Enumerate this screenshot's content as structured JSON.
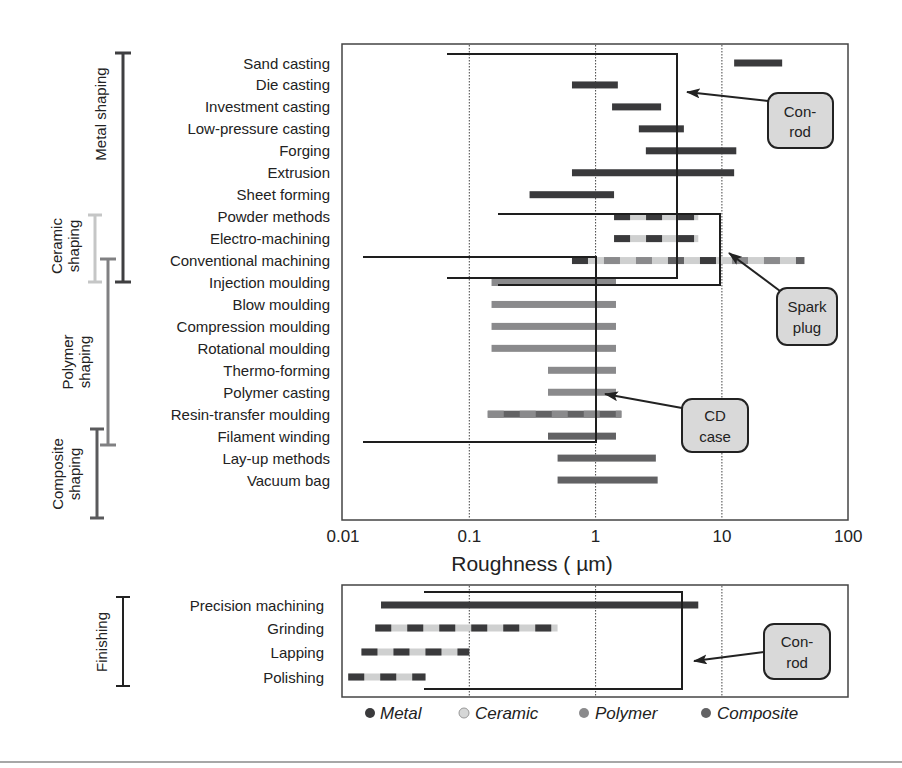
{
  "chart_data": [
    {
      "type": "bar",
      "subtype": "range-bar (floating horizontal bars, log x-axis)",
      "panel": "shaping",
      "xlabel": "Roughness ( µm)",
      "xscale": "log",
      "xlim": [
        0.01,
        100
      ],
      "xticks": [
        "0.01",
        "0.1",
        "1",
        "10",
        "100"
      ],
      "grid": "vertical dotted lines at 0.1, 1, 10",
      "categories": [
        "Sand casting",
        "Die casting",
        "Investment casting",
        "Low-pressure casting",
        "Forging",
        "Extrusion",
        "Sheet forming",
        "Powder methods",
        "Electro-machining",
        "Conventional machining",
        "Injection moulding",
        "Blow moulding",
        "Compression moulding",
        "Rotational moulding",
        "Thermo-forming",
        "Polymer casting",
        "Resin-transfer moulding",
        "Filament winding",
        "Lay-up methods",
        "Vacuum bag"
      ],
      "ranges": [
        {
          "process": "Sand casting",
          "min": 12.5,
          "max": 30,
          "materials": [
            "Metal"
          ]
        },
        {
          "process": "Die casting",
          "min": 0.65,
          "max": 1.5,
          "materials": [
            "Metal"
          ]
        },
        {
          "process": "Investment casting",
          "min": 1.35,
          "max": 3.3,
          "materials": [
            "Metal"
          ]
        },
        {
          "process": "Low-pressure casting",
          "min": 2.2,
          "max": 5,
          "materials": [
            "Metal"
          ]
        },
        {
          "process": "Forging",
          "min": 2.5,
          "max": 13,
          "materials": [
            "Metal"
          ]
        },
        {
          "process": "Extrusion",
          "min": 0.65,
          "max": 12.5,
          "materials": [
            "Metal"
          ]
        },
        {
          "process": "Sheet forming",
          "min": 0.3,
          "max": 1.4,
          "materials": [
            "Metal"
          ]
        },
        {
          "process": "Powder methods",
          "min": 1.4,
          "max": 6.5,
          "materials": [
            "Metal",
            "Ceramic"
          ]
        },
        {
          "process": "Electro-machining",
          "min": 1.4,
          "max": 6.5,
          "materials": [
            "Metal",
            "Ceramic"
          ]
        },
        {
          "process": "Conventional machining",
          "min": 0.65,
          "max": 45,
          "materials": [
            "Metal",
            "Ceramic",
            "Polymer",
            "Composite"
          ]
        },
        {
          "process": "Injection moulding",
          "min": 0.15,
          "max": 1.45,
          "materials": [
            "Polymer"
          ]
        },
        {
          "process": "Blow moulding",
          "min": 0.15,
          "max": 1.45,
          "materials": [
            "Polymer"
          ]
        },
        {
          "process": "Compression moulding",
          "min": 0.15,
          "max": 1.45,
          "materials": [
            "Polymer"
          ]
        },
        {
          "process": "Rotational moulding",
          "min": 0.15,
          "max": 1.45,
          "materials": [
            "Polymer"
          ]
        },
        {
          "process": "Thermo-forming",
          "min": 0.42,
          "max": 1.45,
          "materials": [
            "Polymer"
          ]
        },
        {
          "process": "Polymer casting",
          "min": 0.42,
          "max": 1.45,
          "materials": [
            "Polymer"
          ]
        },
        {
          "process": "Resin-transfer moulding",
          "min": 0.14,
          "max": 1.6,
          "materials": [
            "Polymer",
            "Composite"
          ]
        },
        {
          "process": "Filament winding",
          "min": 0.42,
          "max": 1.45,
          "materials": [
            "Composite"
          ]
        },
        {
          "process": "Lay-up methods",
          "min": 0.5,
          "max": 3.0,
          "materials": [
            "Composite"
          ]
        },
        {
          "process": "Vacuum bag",
          "min": 0.5,
          "max": 3.1,
          "materials": [
            "Composite"
          ]
        }
      ],
      "groups": [
        {
          "label": "Metal shaping",
          "from": "Sand casting",
          "to": "Conventional machining"
        },
        {
          "label": "Ceramic shaping",
          "from": "Powder methods",
          "to": "Conventional machining"
        },
        {
          "label": "Polymer shaping",
          "from": "Conventional machining",
          "to": "Resin-transfer moulding"
        },
        {
          "label": "Composite shaping",
          "from": "Resin-transfer moulding",
          "to": "Vacuum bag"
        }
      ],
      "annotations": [
        {
          "label": "Con-rod",
          "box_min": 0.07,
          "box_max": 4.4,
          "rows": "Sand casting → Conventional machining"
        },
        {
          "label": "Spark plug",
          "box_min": 0.16,
          "box_max": 9.5,
          "rows": "Powder methods → Conventional machining"
        },
        {
          "label": "CD case",
          "box_min": 0.015,
          "box_max": 1.0,
          "rows": "Conventional machining → Resin-transfer moulding"
        }
      ]
    },
    {
      "type": "bar",
      "subtype": "range-bar (floating horizontal bars, log x-axis)",
      "panel": "finishing",
      "xscale": "log",
      "xlim": [
        0.01,
        100
      ],
      "grid": "vertical dotted lines at 0.1, 1, 10",
      "categories": [
        "Precision machining",
        "Grinding",
        "Lapping",
        "Polishing"
      ],
      "ranges": [
        {
          "process": "Precision machining",
          "min": 0.02,
          "max": 6.5,
          "materials": [
            "Metal"
          ]
        },
        {
          "process": "Grinding",
          "min": 0.018,
          "max": 0.5,
          "materials": [
            "Metal",
            "Ceramic"
          ]
        },
        {
          "process": "Lapping",
          "min": 0.014,
          "max": 0.1,
          "materials": [
            "Metal",
            "Ceramic"
          ]
        },
        {
          "process": "Polishing",
          "min": 0.011,
          "max": 0.045,
          "materials": [
            "Metal",
            "Ceramic"
          ]
        }
      ],
      "groups": [
        {
          "label": "Finishing",
          "from": "Precision machining",
          "to": "Polishing"
        }
      ],
      "annotations": [
        {
          "label": "Con-rod",
          "box_min": 0.068,
          "box_max": 4.8,
          "rows": "Precision machining → Polishing"
        }
      ],
      "legend": [
        "Metal",
        "Ceramic",
        "Polymer",
        "Composite"
      ],
      "legend_position": "bottom"
    }
  ],
  "labels": {
    "xlabel": "Roughness ( µm)",
    "xticks": [
      "0.01",
      "0.1",
      "1",
      "10",
      "100"
    ],
    "groups": {
      "metal": "Metal shaping",
      "ceramic_1": "Ceramic",
      "ceramic_2": "shaping",
      "polymer_1": "Polymer",
      "polymer_2": "shaping",
      "composite_1": "Composite",
      "composite_2": "shaping",
      "finishing": "Finishing"
    },
    "callouts": {
      "conrod_1": "Con-",
      "conrod_2": "rod",
      "spark_1": "Spark",
      "spark_2": "plug",
      "cd_1": "CD",
      "cd_2": "case",
      "conrod_fin_1": "Con-",
      "conrod_fin_2": "rod"
    },
    "legend": {
      "metal": "Metal",
      "ceramic": "Ceramic",
      "polymer": "Polymer",
      "composite": "Composite"
    }
  },
  "colors": {
    "metal": "#3a3a3c",
    "ceramic": "#cfd0d0",
    "polymer": "#8a8a8c",
    "composite": "#626264",
    "axis": "#333333",
    "grid": "#444444",
    "callout_fill": "#d9d9d9",
    "outline": "#1e1e1e"
  }
}
